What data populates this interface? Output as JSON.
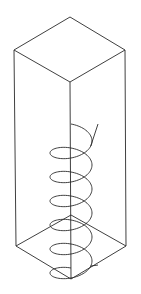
{
  "figure": {
    "colors": {
      "background": "#ffffff",
      "line": "#2a2a2a"
    },
    "box": {
      "top_back": [
        70,
        17
      ],
      "top_left": [
        14,
        50
      ],
      "top_right": [
        125,
        50
      ],
      "top_front": [
        70,
        82
      ],
      "bottom_back": [
        71,
        215
      ],
      "bottom_left": [
        16,
        246
      ],
      "bottom_right": [
        126,
        246
      ],
      "bottom_front": [
        71,
        279
      ]
    },
    "helix": {
      "center_x": 71,
      "radius_x": 21,
      "radius_y": 11,
      "turns": 6,
      "top_y": 124,
      "pitch": 24,
      "top_tail_end": [
        98,
        124
      ],
      "bottom_tail_end": [
        98,
        265
      ]
    }
  }
}
